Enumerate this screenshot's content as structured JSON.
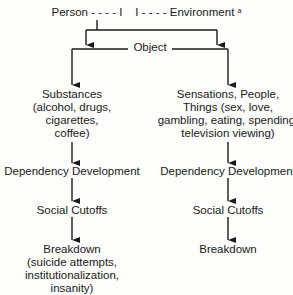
{
  "header": {
    "person": "Person",
    "dash_left": "- - - - I",
    "dash_right": "I - - - -",
    "environment": "Environment",
    "footnote": "a"
  },
  "object_label": "Object",
  "left_column": {
    "top": [
      "Substances",
      "(alcohol, drugs,",
      "cigarettes,",
      "coffee)"
    ],
    "dependency": "Dependency Development",
    "cutoffs": "Social Cutoffs",
    "breakdown": [
      "Breakdown",
      "(suicide attempts,",
      "institutionalization,",
      "insanity)"
    ]
  },
  "right_column": {
    "top": [
      "Sensations, People,",
      "Things (sex, love,",
      "gambling, eating, spending,",
      "television viewing)"
    ],
    "dependency": "Dependency Development",
    "cutoffs": "Social Cutoffs",
    "breakdown": [
      "Breakdown"
    ]
  },
  "colors": {
    "line": "#1a1a1a",
    "background": "#fdfdfb"
  }
}
